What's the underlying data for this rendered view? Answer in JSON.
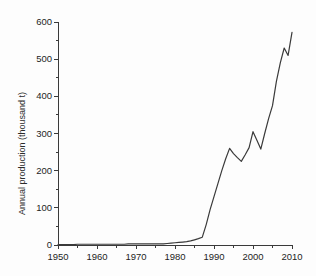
{
  "chart_data": {
    "type": "line",
    "title": "",
    "xlabel": "",
    "ylabel": "Annual production (thousand t)",
    "xlim": [
      1950,
      2010
    ],
    "ylim": [
      0,
      600
    ],
    "xticks": [
      1950,
      1960,
      1970,
      1980,
      1990,
      2000,
      2010
    ],
    "yticks": [
      0,
      100,
      200,
      300,
      400,
      500,
      600
    ],
    "xtick_labels": [
      "1950",
      "1960",
      "1970",
      "1980",
      "1990",
      "2000",
      "2010"
    ],
    "ytick_labels": [
      "0",
      "100",
      "200",
      "300",
      "400",
      "500",
      "600"
    ],
    "x_minor_tick_interval": 5,
    "y_minor_tick_interval": 50,
    "grid": false,
    "legend": null,
    "line_color": "#3a3a3a",
    "series": [
      {
        "name": "Annual production",
        "x": [
          1950,
          1951,
          1952,
          1953,
          1954,
          1955,
          1956,
          1957,
          1958,
          1959,
          1960,
          1961,
          1962,
          1963,
          1964,
          1965,
          1966,
          1967,
          1968,
          1969,
          1970,
          1971,
          1972,
          1973,
          1974,
          1975,
          1976,
          1977,
          1978,
          1979,
          1980,
          1981,
          1982,
          1983,
          1984,
          1985,
          1986,
          1987,
          1988,
          1989,
          1990,
          1991,
          1992,
          1993,
          1994,
          1995,
          1996,
          1997,
          1998,
          1999,
          2000,
          2001,
          2002,
          2003,
          2004,
          2005,
          2006,
          2007,
          2008,
          2009,
          2010
        ],
        "values": [
          1,
          1,
          1,
          1,
          1,
          2,
          2,
          2,
          2,
          2,
          2,
          2,
          2,
          2,
          2,
          2,
          2,
          2,
          3,
          3,
          3,
          3,
          3,
          3,
          3,
          3,
          3,
          3,
          4,
          5,
          6,
          7,
          8,
          9,
          11,
          14,
          17,
          21,
          55,
          95,
          130,
          165,
          200,
          232,
          260,
          246,
          235,
          225,
          243,
          262,
          305,
          282,
          258,
          300,
          340,
          375,
          440,
          490,
          530,
          510,
          572
        ]
      }
    ]
  },
  "axis": {
    "y_title": "Annual production (thousand t)"
  }
}
